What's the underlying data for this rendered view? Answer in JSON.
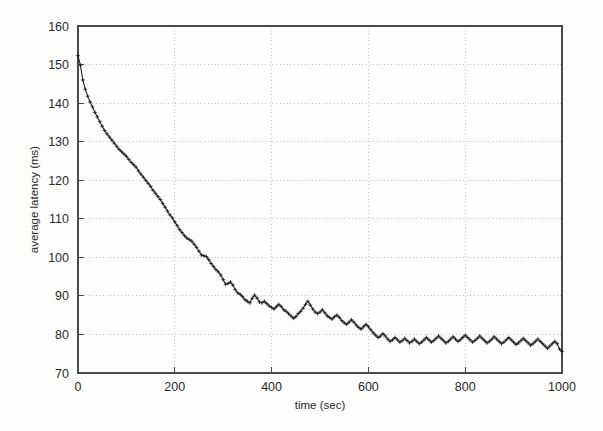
{
  "figure": {
    "name": "average-latency-vs-time-plot",
    "background_color": "#fdfdfc",
    "frame_color": "#4a4a4a",
    "grid_color": "#b9b9b9",
    "series_color": "#1e1e1e"
  },
  "chart_data": {
    "type": "line",
    "title": "",
    "xlabel": "time (sec)",
    "ylabel": "average latency (ms)",
    "xlim": [
      0,
      1000
    ],
    "ylim": [
      70,
      160
    ],
    "xticks": [
      0,
      200,
      400,
      600,
      800,
      1000
    ],
    "yticks": [
      70,
      80,
      90,
      100,
      110,
      120,
      130,
      140,
      150,
      160
    ],
    "xtick_labels": [
      "0",
      "200",
      "400",
      "600",
      "800",
      "1000"
    ],
    "ytick_labels": [
      "70",
      "80",
      "90",
      "100",
      "110",
      "120",
      "130",
      "140",
      "150",
      "160"
    ],
    "grid": true,
    "grid_style": "dotted",
    "legend": null,
    "marker": "plus",
    "series": [
      {
        "name": "average latency",
        "x": [
          0,
          5,
          10,
          15,
          20,
          25,
          30,
          35,
          40,
          45,
          50,
          55,
          60,
          65,
          70,
          75,
          80,
          85,
          90,
          95,
          100,
          105,
          110,
          115,
          120,
          125,
          130,
          135,
          140,
          145,
          150,
          155,
          160,
          165,
          170,
          175,
          180,
          185,
          190,
          195,
          200,
          205,
          210,
          215,
          220,
          225,
          230,
          235,
          240,
          245,
          250,
          255,
          260,
          265,
          270,
          275,
          280,
          285,
          290,
          295,
          300,
          305,
          310,
          315,
          320,
          325,
          330,
          335,
          340,
          345,
          350,
          355,
          360,
          365,
          370,
          375,
          380,
          385,
          390,
          395,
          400,
          405,
          410,
          415,
          420,
          425,
          430,
          435,
          440,
          445,
          450,
          455,
          460,
          465,
          470,
          475,
          480,
          485,
          490,
          495,
          500,
          505,
          510,
          515,
          520,
          525,
          530,
          535,
          540,
          545,
          550,
          555,
          560,
          565,
          570,
          575,
          580,
          585,
          590,
          595,
          600,
          605,
          610,
          615,
          620,
          625,
          630,
          635,
          640,
          645,
          650,
          655,
          660,
          665,
          670,
          675,
          680,
          685,
          690,
          695,
          700,
          705,
          710,
          715,
          720,
          725,
          730,
          735,
          740,
          745,
          750,
          755,
          760,
          765,
          770,
          775,
          780,
          785,
          790,
          795,
          800,
          805,
          810,
          815,
          820,
          825,
          830,
          835,
          840,
          845,
          850,
          855,
          860,
          865,
          870,
          875,
          880,
          885,
          890,
          895,
          900,
          905,
          910,
          915,
          920,
          925,
          930,
          935,
          940,
          945,
          950,
          955,
          960,
          965,
          970,
          975,
          980,
          985,
          990,
          995,
          1000
        ],
        "y": [
          152.3,
          149.8,
          146.0,
          143.6,
          141.8,
          140.3,
          139.0,
          137.6,
          136.4,
          135.2,
          134.0,
          132.9,
          132.0,
          131.2,
          130.4,
          129.6,
          128.8,
          128.0,
          127.4,
          126.8,
          126.2,
          125.4,
          124.6,
          124.0,
          123.4,
          122.4,
          121.6,
          120.8,
          120.0,
          119.2,
          118.4,
          117.4,
          116.6,
          115.8,
          115.0,
          114.0,
          113.0,
          112.0,
          111.0,
          110.2,
          109.2,
          108.2,
          107.2,
          106.4,
          105.6,
          105.0,
          104.6,
          104.2,
          103.4,
          102.6,
          101.6,
          100.6,
          100.4,
          100.2,
          99.4,
          98.4,
          97.6,
          96.8,
          96.2,
          95.4,
          94.2,
          93.0,
          93.2,
          93.6,
          92.8,
          91.6,
          90.8,
          90.4,
          89.8,
          89.0,
          88.6,
          88.2,
          89.4,
          90.2,
          89.4,
          88.4,
          88.2,
          88.6,
          88.0,
          87.4,
          87.0,
          86.6,
          87.2,
          87.8,
          87.2,
          86.4,
          86.0,
          85.4,
          84.8,
          84.2,
          84.6,
          85.4,
          86.0,
          86.8,
          87.8,
          88.6,
          87.6,
          86.6,
          85.8,
          85.4,
          85.8,
          86.4,
          85.6,
          84.8,
          84.4,
          84.0,
          84.6,
          85.0,
          84.4,
          83.6,
          83.0,
          82.6,
          83.2,
          83.8,
          83.2,
          82.4,
          81.8,
          81.4,
          82.0,
          82.6,
          82.0,
          81.2,
          80.4,
          79.8,
          79.2,
          79.6,
          80.2,
          79.6,
          78.8,
          78.2,
          78.6,
          79.2,
          78.6,
          78.0,
          78.4,
          79.0,
          78.4,
          77.8,
          78.2,
          78.8,
          78.2,
          77.6,
          78.0,
          78.6,
          79.2,
          78.6,
          78.0,
          78.4,
          79.0,
          79.6,
          79.0,
          78.4,
          77.8,
          78.2,
          78.8,
          79.4,
          78.8,
          78.2,
          78.6,
          79.2,
          79.8,
          79.2,
          78.6,
          78.0,
          78.4,
          79.0,
          79.6,
          79.0,
          78.4,
          77.8,
          78.2,
          78.8,
          79.4,
          78.8,
          78.2,
          77.6,
          78.0,
          78.6,
          79.2,
          78.6,
          78.0,
          77.4,
          77.8,
          78.4,
          79.0,
          78.4,
          77.8,
          77.2,
          77.6,
          78.2,
          78.8,
          78.2,
          77.6,
          77.0,
          76.4,
          77.0,
          77.6,
          78.2,
          77.6,
          76.2,
          75.6
        ]
      }
    ]
  }
}
